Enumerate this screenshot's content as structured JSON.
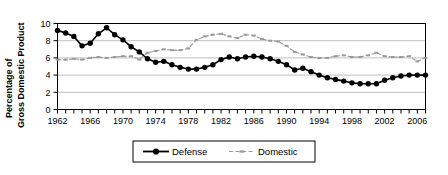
{
  "chart_data": {
    "type": "line",
    "title": "",
    "subtitle": "",
    "xlabel": "",
    "ylabel_line1": "Percentage of",
    "ylabel_line2": "Gross Domestic Product",
    "ylabel": "Percentage of Gross Domestic Product",
    "grid": true,
    "legend_position": "bottom",
    "xlim": [
      1962,
      2007
    ],
    "ylim": [
      0,
      10
    ],
    "yticks": [
      0,
      2,
      4,
      6,
      8,
      10
    ],
    "ytick_labels": [
      "0",
      "2",
      "4",
      "6",
      "8",
      "10"
    ],
    "xticks": [
      1962,
      1963,
      1964,
      1965,
      1966,
      1967,
      1968,
      1969,
      1970,
      1971,
      1972,
      1973,
      1974,
      1975,
      1976,
      1977,
      1978,
      1979,
      1980,
      1981,
      1982,
      1983,
      1984,
      1985,
      1986,
      1987,
      1988,
      1989,
      1990,
      1991,
      1992,
      1993,
      1994,
      1995,
      1996,
      1997,
      1998,
      1999,
      2000,
      2001,
      2002,
      2003,
      2004,
      2005,
      2006,
      2007
    ],
    "xtick_labels_shown": [
      "1962",
      "1966",
      "1970",
      "1974",
      "1978",
      "1982",
      "1986",
      "1990",
      "1994",
      "1998",
      "2002",
      "2006"
    ],
    "x": [
      1962,
      1963,
      1964,
      1965,
      1966,
      1967,
      1968,
      1969,
      1970,
      1971,
      1972,
      1973,
      1974,
      1975,
      1976,
      1977,
      1978,
      1979,
      1980,
      1981,
      1982,
      1983,
      1984,
      1985,
      1986,
      1987,
      1988,
      1989,
      1990,
      1991,
      1992,
      1993,
      1994,
      1995,
      1996,
      1997,
      1998,
      1999,
      2000,
      2001,
      2002,
      2003,
      2004,
      2005,
      2006,
      2007
    ],
    "series": [
      {
        "name": "Defense",
        "color": "#000000",
        "marker": "filled-circle",
        "line_style": "solid",
        "values": [
          9.2,
          8.9,
          8.5,
          7.4,
          7.7,
          8.8,
          9.5,
          8.7,
          8.1,
          7.3,
          6.7,
          5.9,
          5.5,
          5.6,
          5.2,
          4.9,
          4.7,
          4.7,
          4.9,
          5.2,
          5.8,
          6.1,
          5.9,
          6.1,
          6.2,
          6.1,
          5.9,
          5.6,
          5.2,
          4.6,
          4.8,
          4.4,
          4.0,
          3.7,
          3.5,
          3.3,
          3.1,
          3.0,
          3.0,
          3.0,
          3.4,
          3.7,
          3.9,
          4.0,
          4.0,
          4.0
        ]
      },
      {
        "name": "Domestic",
        "color": "#999999",
        "marker": "small-dash",
        "line_style": "dashed",
        "values": [
          5.8,
          5.8,
          5.9,
          5.8,
          6.0,
          6.1,
          6.0,
          6.1,
          6.2,
          6.2,
          5.8,
          6.6,
          6.8,
          7.0,
          6.9,
          6.9,
          7.1,
          8.1,
          8.5,
          8.7,
          8.8,
          8.5,
          8.3,
          8.7,
          8.6,
          8.2,
          8.0,
          7.9,
          7.4,
          6.7,
          6.4,
          6.1,
          6.0,
          6.0,
          6.2,
          6.3,
          6.1,
          6.1,
          6.3,
          6.6,
          6.2,
          6.1,
          6.1,
          6.2,
          5.6,
          6.0
        ]
      }
    ],
    "legend": [
      {
        "label": "Defense",
        "color": "#000000",
        "marker": "filled-circle",
        "line_style": "solid"
      },
      {
        "label": "Domestic",
        "color": "#999999",
        "marker": "small-dash",
        "line_style": "dashed"
      }
    ]
  }
}
